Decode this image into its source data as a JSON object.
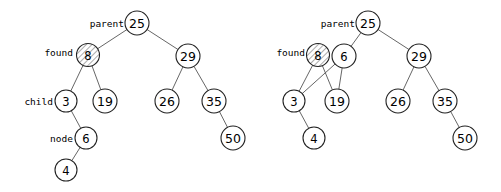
{
  "figure": {
    "background_color": "#ffffff",
    "node_fill": "#ffffff",
    "node_stroke": "#222222",
    "edge_color": "#555555",
    "hatch_color": "#444444"
  },
  "diagrams": [
    {
      "id": "left-tree",
      "caption": "",
      "nodes": [
        {
          "id": "L25",
          "label": "25",
          "cx": 137,
          "cy": 23,
          "r": 12,
          "hatched": false
        },
        {
          "id": "L8",
          "label": "8",
          "cx": 88,
          "cy": 55,
          "r": 11.5,
          "hatched": true
        },
        {
          "id": "L29",
          "label": "29",
          "cx": 188,
          "cy": 56,
          "r": 12,
          "hatched": false
        },
        {
          "id": "L3",
          "label": "3",
          "cx": 66,
          "cy": 101,
          "r": 11,
          "hatched": false
        },
        {
          "id": "L19",
          "label": "19",
          "cx": 105,
          "cy": 101,
          "r": 12,
          "hatched": false
        },
        {
          "id": "L26",
          "label": "26",
          "cx": 167,
          "cy": 101,
          "r": 12,
          "hatched": false
        },
        {
          "id": "L35",
          "label": "35",
          "cx": 214,
          "cy": 101,
          "r": 12,
          "hatched": false
        },
        {
          "id": "L6",
          "label": "6",
          "cx": 86,
          "cy": 138,
          "r": 11,
          "hatched": false
        },
        {
          "id": "L50",
          "label": "50",
          "cx": 233,
          "cy": 138,
          "r": 12,
          "hatched": false
        },
        {
          "id": "L4",
          "label": "4",
          "cx": 66,
          "cy": 170,
          "r": 11,
          "hatched": false
        }
      ],
      "edges": [
        {
          "from": "L25",
          "to": "L8"
        },
        {
          "from": "L25",
          "to": "L29"
        },
        {
          "from": "L8",
          "to": "L3"
        },
        {
          "from": "L8",
          "to": "L19"
        },
        {
          "from": "L29",
          "to": "L26"
        },
        {
          "from": "L29",
          "to": "L35"
        },
        {
          "from": "L3",
          "to": "L6"
        },
        {
          "from": "L35",
          "to": "L50"
        },
        {
          "from": "L6",
          "to": "L4"
        }
      ],
      "annotations": [
        {
          "id": "L-parent",
          "text": "parent",
          "x": 124,
          "y": 23,
          "for": "L25"
        },
        {
          "id": "L-found",
          "text": "found",
          "x": 73,
          "y": 52,
          "for": "L8"
        },
        {
          "id": "L-child",
          "text": "child",
          "x": 53,
          "y": 101,
          "for": "L3"
        },
        {
          "id": "L-node",
          "text": "node",
          "x": 73,
          "y": 138,
          "for": "L6"
        }
      ]
    },
    {
      "id": "right-tree",
      "caption": "",
      "nodes": [
        {
          "id": "R25",
          "label": "25",
          "cx": 368,
          "cy": 23,
          "r": 12,
          "hatched": false
        },
        {
          "id": "R8",
          "label": "8",
          "cx": 318,
          "cy": 55,
          "r": 11.5,
          "hatched": true
        },
        {
          "id": "R6",
          "label": "6",
          "cx": 344,
          "cy": 56,
          "r": 12,
          "hatched": false
        },
        {
          "id": "R29",
          "label": "29",
          "cx": 419,
          "cy": 56,
          "r": 12,
          "hatched": false
        },
        {
          "id": "R3",
          "label": "3",
          "cx": 294,
          "cy": 101,
          "r": 11,
          "hatched": false
        },
        {
          "id": "R19",
          "label": "19",
          "cx": 337,
          "cy": 101,
          "r": 12,
          "hatched": false
        },
        {
          "id": "R26",
          "label": "26",
          "cx": 398,
          "cy": 101,
          "r": 12,
          "hatched": false
        },
        {
          "id": "R35",
          "label": "35",
          "cx": 445,
          "cy": 101,
          "r": 12,
          "hatched": false
        },
        {
          "id": "R4",
          "label": "4",
          "cx": 314,
          "cy": 138,
          "r": 11,
          "hatched": false
        },
        {
          "id": "R50",
          "label": "50",
          "cx": 465,
          "cy": 138,
          "r": 12,
          "hatched": false
        }
      ],
      "edges": [
        {
          "from": "R25",
          "to": "R6"
        },
        {
          "from": "R25",
          "to": "R29"
        },
        {
          "from": "R8",
          "to": "R3"
        },
        {
          "from": "R8",
          "to": "R19"
        },
        {
          "from": "R6",
          "to": "R3"
        },
        {
          "from": "R6",
          "to": "R19"
        },
        {
          "from": "R29",
          "to": "R26"
        },
        {
          "from": "R29",
          "to": "R35"
        },
        {
          "from": "R3",
          "to": "R4"
        },
        {
          "from": "R35",
          "to": "R50"
        }
      ],
      "annotations": [
        {
          "id": "R-parent",
          "text": "parent",
          "x": 355,
          "y": 23,
          "for": "R25"
        },
        {
          "id": "R-found",
          "text": "found",
          "x": 305,
          "y": 52,
          "for": "R8"
        }
      ]
    }
  ]
}
